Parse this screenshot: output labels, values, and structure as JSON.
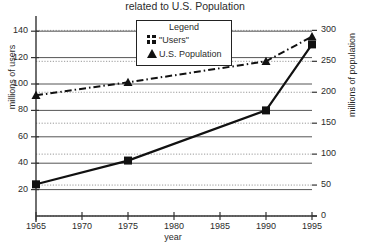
{
  "chart_data": {
    "type": "line",
    "title": "related to U.S. Population",
    "xlabel": "year",
    "ylabel": "millions of users",
    "ylabel_right": "millions of population",
    "x": [
      1965,
      1975,
      1990,
      1995
    ],
    "xlim": [
      1965,
      1995
    ],
    "xticks": [
      "1965",
      "1970",
      "1975",
      "1980",
      "1985",
      "1990",
      "1995"
    ],
    "xtick_values": [
      1965,
      1970,
      1975,
      1980,
      1985,
      1990,
      1995
    ],
    "ylim_left": [
      0,
      150
    ],
    "yticks_left": [
      "20",
      "40",
      "60",
      "80",
      "100",
      "120",
      "140"
    ],
    "ytick_values_left": [
      20,
      40,
      60,
      80,
      100,
      120,
      140
    ],
    "ylim_right": [
      0,
      320
    ],
    "yticks_right": [
      "0",
      "50",
      "100",
      "150",
      "200",
      "250",
      "300"
    ],
    "ytick_values_right": [
      0,
      50,
      100,
      150,
      200,
      250,
      300
    ],
    "grid": "both-axes-horizontal",
    "legend_position": "top-center",
    "series": [
      {
        "name": "\"Users\"",
        "axis": "left",
        "marker": "square",
        "linestyle": "solid",
        "color": "#111111",
        "values": [
          24,
          42,
          80,
          130
        ]
      },
      {
        "name": "U.S. Population",
        "axis": "right",
        "marker": "triangle",
        "linestyle": "dash-dot",
        "color": "#111111",
        "values": [
          195,
          216,
          250,
          290
        ]
      }
    ]
  },
  "legend": {
    "title": "Legend",
    "entries": [
      {
        "label": "\"Users\"",
        "marker": "square"
      },
      {
        "label": "U.S. Population",
        "marker": "triangle"
      }
    ]
  },
  "colors": {
    "ink": "#111111",
    "axis": "#333333",
    "grid_solid": "#555555",
    "grid_dotted": "#999999",
    "background": "#ffffff"
  }
}
